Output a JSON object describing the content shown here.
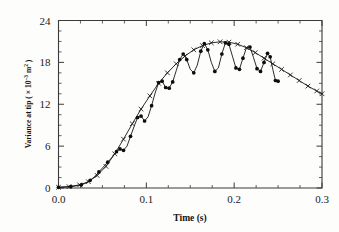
{
  "figure": {
    "name": "variance-at-tip-vs-time-plot",
    "background_color": "#fdfdfb",
    "ink_color": "#151515"
  },
  "axes": {
    "x_title": "Time (s)",
    "y_title_main": "Variance at tip ( × 10",
    "y_title_exponent": "–3",
    "y_title_tail": " m",
    "y_title_tail_exponent": "2",
    "y_title_close": " )",
    "x_tick_labels": [
      "0.0",
      "0.1",
      "0.2",
      "0.3"
    ],
    "y_tick_labels": [
      "0",
      "6",
      "12",
      "18",
      "24"
    ]
  },
  "chart_data": {
    "type": "line",
    "title": "",
    "xlabel": "Time (s)",
    "ylabel": "Variance at tip ( × 10⁻³ m² )",
    "xlim": [
      0.0,
      0.3
    ],
    "ylim": [
      0,
      24
    ],
    "xticks": [
      0.0,
      0.1,
      0.2,
      0.3
    ],
    "yticks": [
      0,
      6,
      12,
      18,
      24
    ],
    "x_minor_tick_step": 0.025,
    "y_minor_tick_step": 1.5,
    "grid": false,
    "legend": "none",
    "series": [
      {
        "name": "smooth-envelope",
        "marker": "cross",
        "line": "solid",
        "points": [
          {
            "x": 0.0,
            "y": 0.1
          },
          {
            "x": 0.012,
            "y": 0.2
          },
          {
            "x": 0.024,
            "y": 0.45
          },
          {
            "x": 0.034,
            "y": 0.9
          },
          {
            "x": 0.044,
            "y": 1.8
          },
          {
            "x": 0.054,
            "y": 3.1
          },
          {
            "x": 0.064,
            "y": 4.9
          },
          {
            "x": 0.074,
            "y": 7.0
          },
          {
            "x": 0.084,
            "y": 9.2
          },
          {
            "x": 0.094,
            "y": 11.3
          },
          {
            "x": 0.104,
            "y": 13.2
          },
          {
            "x": 0.114,
            "y": 15.0
          },
          {
            "x": 0.124,
            "y": 16.5
          },
          {
            "x": 0.134,
            "y": 17.8
          },
          {
            "x": 0.144,
            "y": 18.9
          },
          {
            "x": 0.154,
            "y": 19.8
          },
          {
            "x": 0.164,
            "y": 20.4
          },
          {
            "x": 0.174,
            "y": 20.8
          },
          {
            "x": 0.184,
            "y": 20.95
          },
          {
            "x": 0.194,
            "y": 20.9
          },
          {
            "x": 0.204,
            "y": 20.6
          },
          {
            "x": 0.214,
            "y": 20.1
          },
          {
            "x": 0.224,
            "y": 19.4
          },
          {
            "x": 0.234,
            "y": 18.6
          },
          {
            "x": 0.244,
            "y": 17.8
          },
          {
            "x": 0.254,
            "y": 17.0
          },
          {
            "x": 0.264,
            "y": 16.2
          },
          {
            "x": 0.274,
            "y": 15.4
          },
          {
            "x": 0.284,
            "y": 14.6
          },
          {
            "x": 0.294,
            "y": 13.9
          },
          {
            "x": 0.3,
            "y": 13.5
          }
        ]
      },
      {
        "name": "oscillating-response",
        "marker": "filled-circle",
        "line": "solid",
        "points": [
          {
            "x": 0.0,
            "y": 0.1
          },
          {
            "x": 0.008,
            "y": 0.15
          },
          {
            "x": 0.014,
            "y": 0.2
          },
          {
            "x": 0.02,
            "y": 0.3
          },
          {
            "x": 0.026,
            "y": 0.45
          },
          {
            "x": 0.031,
            "y": 0.7
          },
          {
            "x": 0.036,
            "y": 1.1
          },
          {
            "x": 0.041,
            "y": 1.6
          },
          {
            "x": 0.046,
            "y": 2.3
          },
          {
            "x": 0.051,
            "y": 3.0
          },
          {
            "x": 0.056,
            "y": 3.7
          },
          {
            "x": 0.061,
            "y": 4.4
          },
          {
            "x": 0.066,
            "y": 5.2
          },
          {
            "x": 0.07,
            "y": 5.6
          },
          {
            "x": 0.074,
            "y": 5.4
          },
          {
            "x": 0.078,
            "y": 6.0
          },
          {
            "x": 0.082,
            "y": 7.4
          },
          {
            "x": 0.086,
            "y": 8.8
          },
          {
            "x": 0.09,
            "y": 10.1
          },
          {
            "x": 0.094,
            "y": 10.3
          },
          {
            "x": 0.098,
            "y": 9.6
          },
          {
            "x": 0.102,
            "y": 10.2
          },
          {
            "x": 0.106,
            "y": 11.8
          },
          {
            "x": 0.11,
            "y": 13.6
          },
          {
            "x": 0.114,
            "y": 15.1
          },
          {
            "x": 0.118,
            "y": 15.3
          },
          {
            "x": 0.122,
            "y": 14.4
          },
          {
            "x": 0.126,
            "y": 14.3
          },
          {
            "x": 0.13,
            "y": 15.2
          },
          {
            "x": 0.134,
            "y": 16.8
          },
          {
            "x": 0.138,
            "y": 18.4
          },
          {
            "x": 0.142,
            "y": 19.2
          },
          {
            "x": 0.146,
            "y": 18.4
          },
          {
            "x": 0.15,
            "y": 17.0
          },
          {
            "x": 0.154,
            "y": 16.5
          },
          {
            "x": 0.158,
            "y": 17.6
          },
          {
            "x": 0.162,
            "y": 19.6
          },
          {
            "x": 0.166,
            "y": 20.7
          },
          {
            "x": 0.17,
            "y": 19.8
          },
          {
            "x": 0.174,
            "y": 18.0
          },
          {
            "x": 0.178,
            "y": 16.7
          },
          {
            "x": 0.182,
            "y": 17.2
          },
          {
            "x": 0.186,
            "y": 19.2
          },
          {
            "x": 0.19,
            "y": 20.8
          },
          {
            "x": 0.194,
            "y": 20.6
          },
          {
            "x": 0.198,
            "y": 18.9
          },
          {
            "x": 0.202,
            "y": 17.2
          },
          {
            "x": 0.206,
            "y": 17.0
          },
          {
            "x": 0.21,
            "y": 18.6
          },
          {
            "x": 0.214,
            "y": 20.1
          },
          {
            "x": 0.218,
            "y": 20.2
          },
          {
            "x": 0.222,
            "y": 18.7
          },
          {
            "x": 0.226,
            "y": 17.1
          },
          {
            "x": 0.23,
            "y": 16.7
          },
          {
            "x": 0.234,
            "y": 18.0
          },
          {
            "x": 0.238,
            "y": 19.3
          },
          {
            "x": 0.241,
            "y": 18.8
          },
          {
            "x": 0.244,
            "y": 17.0
          },
          {
            "x": 0.247,
            "y": 15.4
          },
          {
            "x": 0.25,
            "y": 15.3
          }
        ]
      }
    ]
  }
}
